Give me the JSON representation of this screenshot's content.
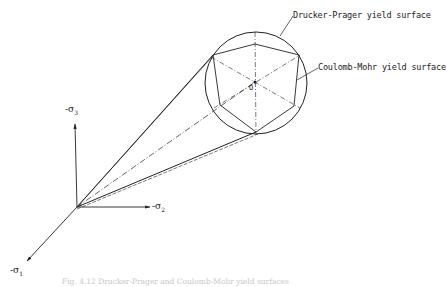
{
  "figure": {
    "caption": "Fig. 4.12  Drucker-Prager and Coulomb-Mohr yield surfaces",
    "labels": {
      "drucker_prager": "Drucker-Prager yield surface",
      "coulomb_mohr": "Coulomb-Mohr yield surface",
      "center": "O"
    },
    "axes": {
      "sigma3": {
        "prefix": "-σ",
        "sub": "3"
      },
      "sigma2": {
        "prefix": "-σ",
        "sub": "2"
      },
      "sigma1": {
        "prefix": "-σ",
        "sub": "1"
      }
    },
    "geometry": {
      "origin": [
        77,
        207
      ],
      "circle_center": [
        256,
        83
      ],
      "circle_radius": 51,
      "hexagon_vertices": [
        [
          255,
          44
        ],
        [
          299,
          55
        ],
        [
          294,
          106
        ],
        [
          256,
          132
        ],
        [
          220,
          105
        ],
        [
          213,
          55
        ]
      ]
    },
    "colors": {
      "line": "#222222",
      "caption": "#c8c8c8"
    }
  }
}
